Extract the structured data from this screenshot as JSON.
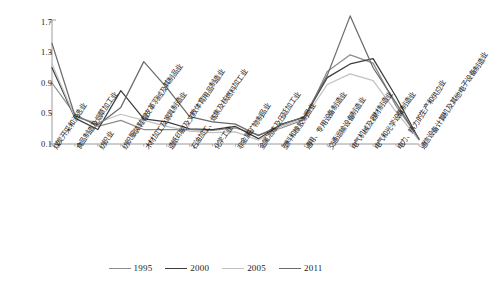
{
  "chart_data": {
    "type": "line",
    "title": "",
    "xlabel": "",
    "ylabel": "",
    "ylim": [
      0.1,
      1.7
    ],
    "yticks": [
      "0.1",
      "0.5",
      "0.9",
      "1.3",
      "1.7"
    ],
    "grid": false,
    "legend_position": "bottom",
    "categories": [
      "煤炭开采和洗选业",
      "食品制造及烟草加工业",
      "纺织业",
      "纺织服装鞋帽皮革羽绒及其制品业",
      "木材加工及家具制造业",
      "造纸印刷及文教体育用品制造业",
      "石油加工、炼焦及核燃料加工业",
      "化学工业",
      "非金属矿物制品业",
      "金属冶炼及压延加工业",
      "塑料和橡胶制品业",
      "通用、专用设备制造业",
      "交通运输设备制造业",
      "电气机械及器材制造业",
      "电气和光学设备制造业",
      "电力、热力的生产和供应业",
      "通信设备计算机及其他电子设备制造业"
    ],
    "series": [
      {
        "name": "1995",
        "color": "#8c8c8c",
        "values": [
          0.9,
          0.49,
          0.33,
          0.41,
          0.29,
          0.29,
          0.29,
          0.28,
          0.31,
          0.22,
          0.31,
          0.42,
          1.05,
          1.27,
          1.16,
          0.6,
          0.17
        ]
      },
      {
        "name": "2000",
        "color": "#3c3c3c",
        "values": [
          1.1,
          0.44,
          0.29,
          0.8,
          0.43,
          0.39,
          0.3,
          0.29,
          0.33,
          0.17,
          0.36,
          0.45,
          0.97,
          1.15,
          1.22,
          0.72,
          0.16
        ]
      },
      {
        "name": "2005",
        "color": "#c2c2c2",
        "values": [
          1.15,
          0.45,
          0.38,
          0.49,
          0.41,
          0.33,
          0.27,
          0.25,
          0.26,
          0.15,
          0.33,
          0.43,
          0.88,
          1.02,
          0.93,
          0.52,
          0.15
        ]
      },
      {
        "name": "2011",
        "color": "#6b6b6b",
        "values": [
          1.42,
          0.47,
          0.35,
          0.58,
          1.18,
          0.84,
          0.46,
          0.39,
          0.36,
          0.21,
          0.35,
          0.46,
          1.0,
          1.78,
          1.1,
          0.64,
          0.16
        ]
      }
    ]
  },
  "axis": {
    "y_tick_labels": [
      "1.7",
      "1.3",
      "0.9",
      "0.5",
      "0.1"
    ]
  },
  "legend": {
    "entries": [
      {
        "label": "1995",
        "color": "#8c8c8c"
      },
      {
        "label": "2000",
        "color": "#3c3c3c"
      },
      {
        "label": "2005",
        "color": "#c2c2c2"
      },
      {
        "label": "2011",
        "color": "#6b6b6b"
      }
    ]
  },
  "colors": {
    "axis": "#9b9b9b",
    "text": "#1a1a1a",
    "background": "#ffffff"
  }
}
